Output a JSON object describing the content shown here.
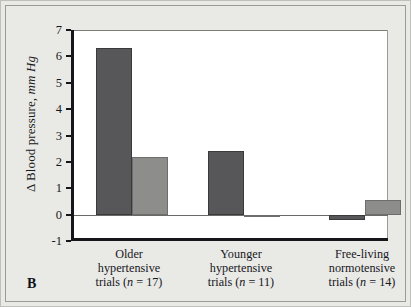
{
  "panel": {
    "letter": "B"
  },
  "chart_data": {
    "type": "bar",
    "title": "",
    "xlabel": "",
    "ylabel": "Δ Blood pressure, mm Hg",
    "ylabel_plain": "Δ Blood pressure,",
    "ylabel_italic": "mm Hg",
    "ylim": [
      -1,
      7
    ],
    "yticks": [
      7,
      6,
      5,
      4,
      3,
      2,
      1,
      0,
      -1
    ],
    "ytick_labels": [
      "7",
      "6",
      "5",
      "4",
      "3",
      "2",
      "1",
      "0",
      "-1"
    ],
    "grid": false,
    "legend": "none",
    "zero_line": 0,
    "categories": [
      "Older hypertensive trials (n = 17)",
      "Younger hypertensive trials (n = 11)",
      "Free-living normotensive trials (n = 14)"
    ],
    "category_lines": [
      [
        "Older",
        "hypertensive",
        "trials (n = 17)"
      ],
      [
        "Younger",
        "hypertensive",
        "trials (n = 11)"
      ],
      [
        "Free-living",
        "normotensive",
        "trials (n = 14)"
      ]
    ],
    "series": [
      {
        "name": "dark",
        "color": "#57575a",
        "values": [
          6.3,
          2.4,
          -0.2
        ]
      },
      {
        "name": "light",
        "color": "#8d8d8c",
        "values": [
          2.2,
          -0.1,
          0.55
        ]
      }
    ]
  },
  "colors": {
    "background": "#e9e9e6",
    "plot_background": "#ffffff",
    "axis": "#15161a",
    "dark_bar": "#57575a",
    "light_bar": "#8d8d8c"
  }
}
